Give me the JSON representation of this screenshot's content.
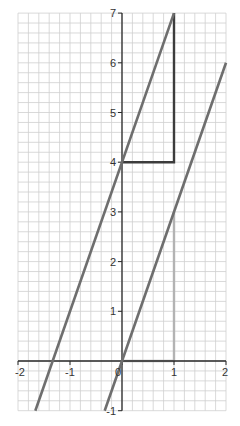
{
  "chart_data": {
    "type": "line",
    "title": "",
    "xlabel": "",
    "ylabel": "",
    "xlim": [
      -2,
      2
    ],
    "ylim": [
      -1,
      7
    ],
    "grid": true,
    "grid_minor_step": 0.2,
    "x_ticks": [
      {
        "value": -2,
        "label": "-2"
      },
      {
        "value": -1,
        "label": "-1"
      },
      {
        "value": 0,
        "label": "0"
      },
      {
        "value": 1,
        "label": "1"
      },
      {
        "value": 2,
        "label": "2"
      }
    ],
    "y_ticks": [
      {
        "value": -1,
        "label": "-1"
      },
      {
        "value": 1,
        "label": "1"
      },
      {
        "value": 2,
        "label": "2"
      },
      {
        "value": 3,
        "label": "3"
      },
      {
        "value": 4,
        "label": "4"
      },
      {
        "value": 5,
        "label": "5"
      },
      {
        "value": 6,
        "label": "6"
      },
      {
        "value": 7,
        "label": "7"
      }
    ],
    "series": [
      {
        "name": "y = 3x + 4",
        "x": [
          -1.667,
          1
        ],
        "y": [
          -1,
          7
        ],
        "color": "#6e6e6e"
      },
      {
        "name": "y = 3x",
        "x": [
          -0.333,
          2
        ],
        "y": [
          -1,
          6
        ],
        "color": "#6e6e6e"
      }
    ],
    "annotations": [
      {
        "type": "gradient-triangle",
        "points": [
          [
            0,
            4
          ],
          [
            1,
            4
          ],
          [
            1,
            7
          ]
        ],
        "color": "#3c3c3c",
        "note": "run 1, rise 3"
      },
      {
        "type": "gradient-triangle",
        "points": [
          [
            0,
            0
          ],
          [
            1,
            0
          ],
          [
            1,
            3
          ]
        ],
        "color": "#b0b0b0",
        "note": "run 1, rise 3"
      }
    ],
    "legend": null
  },
  "colors": {
    "grid": "#cfcfcf",
    "axis": "#2a2a2a",
    "line": "#6e6e6e",
    "triangle_dark": "#3c3c3c",
    "triangle_light": "#b3b3b3"
  }
}
